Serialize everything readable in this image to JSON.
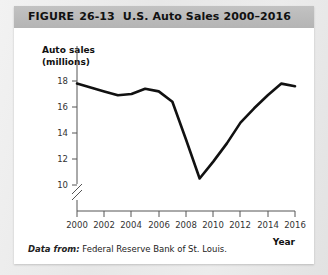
{
  "figure": {
    "label": "FIGURE",
    "number": "26-13",
    "subtitle": "U.S. Auto Sales 2000–2016"
  },
  "source": {
    "lead": "Data from:",
    "text": "Federal Reserve Bank of St. Louis."
  },
  "axis": {
    "y_title_line1": "Auto sales",
    "y_title_line2": "(millions)",
    "x_title": "Year"
  },
  "ticks": {
    "y": [
      "10",
      "12",
      "14",
      "16",
      "18"
    ],
    "x": [
      "2000",
      "2002",
      "2004",
      "2006",
      "2008",
      "2010",
      "2012",
      "2014",
      "2016"
    ]
  },
  "colors": {
    "line": "#111111",
    "axis": "#555555",
    "header_bar": "#b9b9b9",
    "card": "#ffffff",
    "page": "#e9e9e9"
  },
  "chart_data": {
    "type": "line",
    "title": "U.S. Auto Sales 2000–2016",
    "xlabel": "Year",
    "ylabel": "Auto sales (millions)",
    "xlim": [
      2000,
      2016
    ],
    "ylim": [
      10,
      18
    ],
    "y_axis_break": true,
    "grid": false,
    "legend": "none",
    "x": [
      2000,
      2001,
      2002,
      2003,
      2004,
      2005,
      2006,
      2007,
      2008,
      2009,
      2010,
      2011,
      2012,
      2013,
      2014,
      2015,
      2016
    ],
    "series": [
      {
        "name": "U.S. auto sales",
        "values": [
          17.8,
          17.5,
          17.2,
          16.9,
          17.0,
          17.4,
          17.2,
          16.4,
          13.5,
          10.5,
          11.8,
          13.2,
          14.8,
          15.9,
          16.9,
          17.8,
          17.6
        ]
      }
    ],
    "annotations": [
      "Sharp decline from 2007 to trough in 2009",
      "Steady recovery from 2009 through 2015"
    ]
  }
}
